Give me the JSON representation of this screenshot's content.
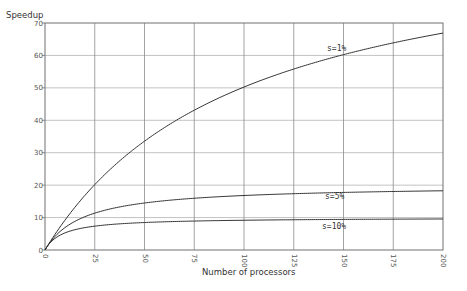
{
  "chart_data": {
    "type": "line",
    "title": "",
    "xlabel": "Number of processors",
    "ylabel": "Speedup",
    "xlim": [
      0,
      200
    ],
    "ylim": [
      0,
      70
    ],
    "xticks": [
      0,
      25,
      50,
      75,
      100,
      125,
      150,
      175,
      200
    ],
    "yticks": [
      0,
      10,
      20,
      30,
      40,
      50,
      60,
      70
    ],
    "grid": true,
    "legend": "inline labels on curves",
    "x": [
      1,
      5,
      10,
      25,
      50,
      75,
      100,
      125,
      150,
      175,
      200
    ],
    "series": [
      {
        "name": "s=1%",
        "values": [
          1.0,
          4.81,
          9.17,
          20.16,
          33.56,
          43.17,
          50.25,
          55.8,
          60.24,
          63.89,
          66.89
        ]
      },
      {
        "name": "s=5%",
        "values": [
          1.0,
          4.17,
          6.9,
          11.36,
          14.49,
          15.96,
          16.81,
          17.36,
          17.75,
          18.04,
          18.26
        ]
      },
      {
        "name": "s=10%",
        "values": [
          1.0,
          3.57,
          5.26,
          7.35,
          8.47,
          8.93,
          9.17,
          9.33,
          9.43,
          9.5,
          9.57
        ]
      }
    ]
  },
  "labels": {
    "ylabel": "Speedup",
    "xlabel": "Number of processors",
    "s1": "s=1%",
    "s5": "s=5%",
    "s10": "s=10%"
  },
  "ticks": {
    "x": [
      "0",
      "25",
      "50",
      "75",
      "100",
      "125",
      "150",
      "175",
      "200"
    ],
    "y": [
      "0",
      "10",
      "20",
      "30",
      "40",
      "50",
      "60",
      "70"
    ]
  }
}
